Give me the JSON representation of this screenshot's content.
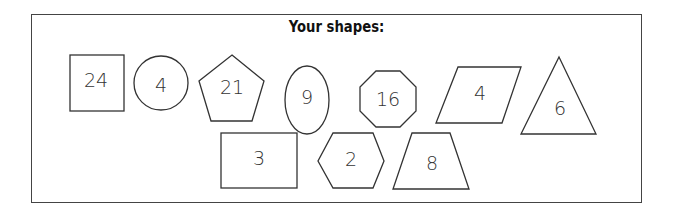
{
  "title": "Your shapes:",
  "shapes": [
    {
      "type": "square",
      "label": "24"
    },
    {
      "type": "circle",
      "label": "4"
    },
    {
      "type": "pentagon",
      "label": "21"
    },
    {
      "type": "ellipse",
      "label": "9"
    },
    {
      "type": "octagon",
      "label": "16"
    },
    {
      "type": "parallelogram",
      "label": "4"
    },
    {
      "type": "triangle",
      "label": "6"
    },
    {
      "type": "rectangle",
      "label": "3"
    },
    {
      "type": "hexagon",
      "label": "2"
    },
    {
      "type": "trapezoid",
      "label": "8"
    }
  ],
  "colors": {
    "stroke": "#333333",
    "background": "#ffffff"
  }
}
